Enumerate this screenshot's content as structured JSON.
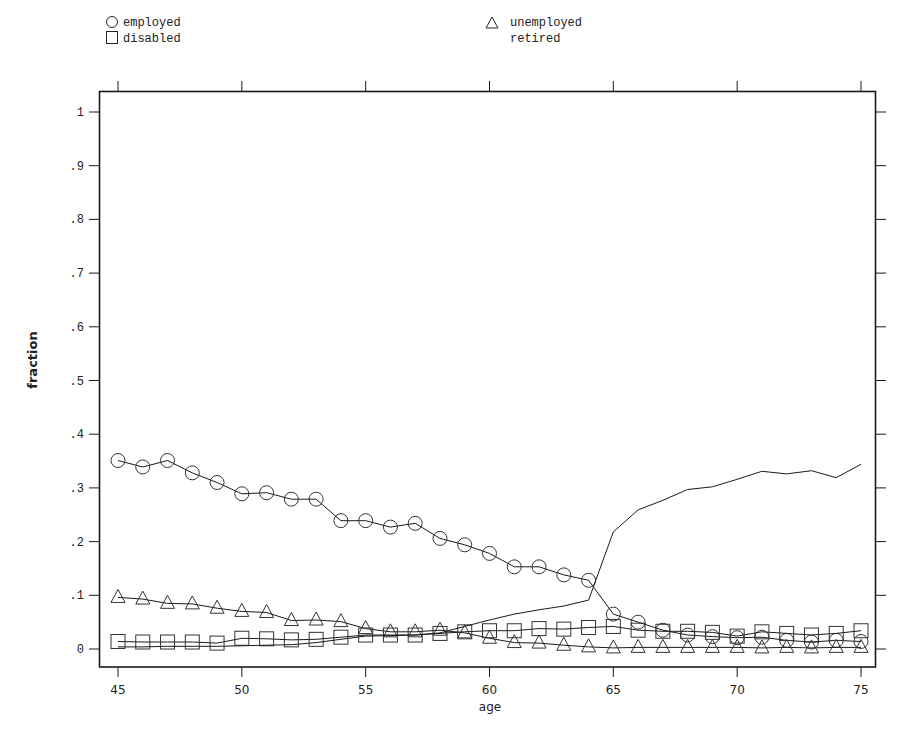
{
  "chart_data": {
    "type": "line",
    "title": "",
    "xlabel": "age",
    "ylabel": "fraction",
    "xlim": [
      45,
      75
    ],
    "ylim": [
      0,
      1
    ],
    "x_ticks": [
      "45",
      "50",
      "55",
      "60",
      "65",
      "70",
      "75"
    ],
    "y_ticks": [
      "0",
      ".1",
      ".2",
      ".3",
      ".4",
      ".5",
      ".6",
      ".7",
      ".8",
      ".9",
      "1"
    ],
    "grid": false,
    "legend_position": "top",
    "x": [
      45,
      46,
      47,
      48,
      49,
      50,
      51,
      52,
      53,
      54,
      55,
      56,
      57,
      58,
      59,
      60,
      61,
      62,
      63,
      64,
      65,
      66,
      67,
      68,
      69,
      70,
      71,
      72,
      73,
      74,
      75
    ],
    "series": [
      {
        "name": "employed",
        "marker": "circle",
        "values": [
          0.351,
          0.339,
          0.351,
          0.328,
          0.31,
          0.289,
          0.291,
          0.279,
          0.279,
          0.239,
          0.239,
          0.227,
          0.234,
          0.206,
          0.194,
          0.178,
          0.153,
          0.153,
          0.138,
          0.128,
          0.065,
          0.05,
          0.035,
          0.026,
          0.023,
          0.021,
          0.022,
          0.016,
          0.013,
          0.016,
          0.014
        ]
      },
      {
        "name": "unemployed",
        "marker": "triangle",
        "values": [
          0.096,
          0.093,
          0.085,
          0.084,
          0.076,
          0.07,
          0.068,
          0.053,
          0.054,
          0.051,
          0.038,
          0.032,
          0.032,
          0.035,
          0.03,
          0.02,
          0.012,
          0.011,
          0.007,
          0.004,
          0.002,
          0.003,
          0.003,
          0.003,
          0.003,
          0.003,
          0.002,
          0.003,
          0.002,
          0.003,
          0.003
        ]
      },
      {
        "name": "disabled",
        "marker": "square",
        "values": [
          0.014,
          0.013,
          0.013,
          0.013,
          0.011,
          0.02,
          0.019,
          0.017,
          0.018,
          0.022,
          0.026,
          0.026,
          0.026,
          0.029,
          0.032,
          0.034,
          0.034,
          0.038,
          0.037,
          0.04,
          0.042,
          0.035,
          0.033,
          0.033,
          0.031,
          0.024,
          0.032,
          0.029,
          0.026,
          0.029,
          0.034
        ]
      },
      {
        "name": "retired",
        "marker": "none",
        "values": [
          0.004,
          0.004,
          0.005,
          0.005,
          0.005,
          0.006,
          0.007,
          0.008,
          0.012,
          0.018,
          0.024,
          0.025,
          0.026,
          0.03,
          0.042,
          0.054,
          0.065,
          0.073,
          0.08,
          0.091,
          0.218,
          0.259,
          0.277,
          0.297,
          0.302,
          0.316,
          0.331,
          0.326,
          0.332,
          0.319,
          0.344
        ]
      }
    ]
  },
  "legend": {
    "items": [
      {
        "label": "employed",
        "icon": "circle-marker-icon"
      },
      {
        "label": "disabled",
        "icon": "square-marker-icon"
      },
      {
        "label": "unemployed",
        "icon": "triangle-marker-icon"
      },
      {
        "label": "retired",
        "icon": "none"
      }
    ]
  },
  "colors": {
    "ink": "#1a1a1a",
    "background": "#ffffff"
  }
}
